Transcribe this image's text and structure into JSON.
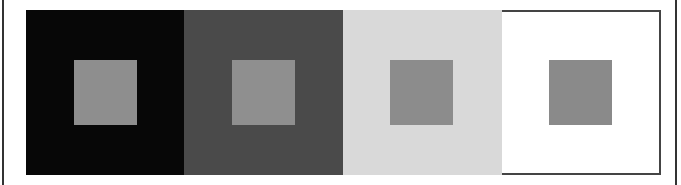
{
  "figure": {
    "panels": [
      {
        "background": "#070707",
        "square": "#8e8e8e"
      },
      {
        "background": "#4a4a4a",
        "square": "#8f8f8f"
      },
      {
        "background": "#d9d9d9",
        "square": "#8c8c8c"
      },
      {
        "background": "#ffffff",
        "square": "#8a8a8a"
      }
    ]
  }
}
